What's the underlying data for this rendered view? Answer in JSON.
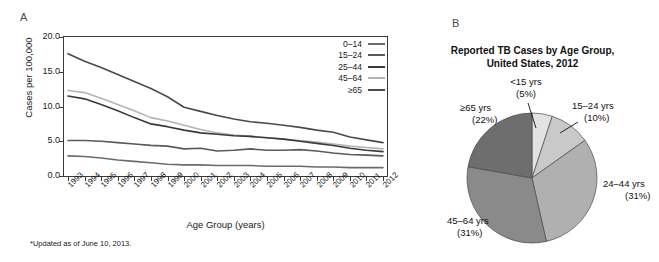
{
  "panel_a": {
    "letter": "A",
    "y_axis_title": "Cases per 100,000",
    "x_axis_title": "Age Group (years)",
    "footnote": "*Updated as of June 10, 2013.",
    "y_ticks": [
      "0.0",
      "5.0",
      "10.0",
      "15.0",
      "20.0"
    ],
    "legend": [
      {
        "label": "0–14",
        "color": "#6b6b6b"
      },
      {
        "label": "15–24",
        "color": "#5a5a5a"
      },
      {
        "label": "25–44",
        "color": "#3a3a3a"
      },
      {
        "label": "45–64",
        "color": "#b4b4b4"
      },
      {
        "label": "≥65",
        "color": "#4a4a4a"
      }
    ]
  },
  "panel_b": {
    "letter": "B",
    "title_line1": "Reported TB Cases by Age Group,",
    "title_line2": "United States, 2012",
    "labels": [
      {
        "name": "<15 yrs",
        "pct": "(5%)"
      },
      {
        "name": "15–24 yrs",
        "pct": "(10%)"
      },
      {
        "name": "24–44 yrs",
        "pct": "(31%)"
      },
      {
        "name": "45–64 yrs",
        "pct": "(31%)"
      },
      {
        "name": "≥65 yrs",
        "pct": "(22%)"
      }
    ]
  },
  "chart_data": [
    {
      "type": "line",
      "title": "",
      "xlabel": "Age Group (years)",
      "ylabel": "Cases per 100,000",
      "ylim": [
        0.0,
        20.0
      ],
      "grid": false,
      "legend_position": "top-right",
      "annotations": [
        "*Updated as of June 10, 2013."
      ],
      "categories": [
        "1993",
        "1994",
        "1995",
        "1996",
        "1997",
        "1998",
        "1999",
        "2000",
        "2001",
        "2002",
        "2003",
        "2004",
        "2005",
        "2006",
        "2007",
        "2008",
        "2009",
        "2010",
        "2011",
        "2012"
      ],
      "series": [
        {
          "name": "≥65",
          "color": "#4a4a4a",
          "values": [
            17.6,
            16.5,
            15.6,
            14.6,
            13.6,
            12.6,
            11.4,
            9.9,
            9.3,
            8.7,
            8.2,
            7.8,
            7.6,
            7.3,
            7.0,
            6.6,
            6.3,
            5.6,
            5.2,
            4.8
          ]
        },
        {
          "name": "45–64",
          "color": "#b4b4b4",
          "values": [
            12.3,
            12.0,
            11.2,
            10.3,
            9.4,
            8.4,
            7.9,
            7.3,
            6.7,
            6.2,
            5.9,
            5.7,
            5.5,
            5.3,
            5.1,
            4.9,
            4.6,
            4.3,
            4.1,
            3.9
          ]
        },
        {
          "name": "25–44",
          "color": "#3a3a3a",
          "values": [
            11.5,
            11.1,
            10.3,
            9.4,
            8.4,
            7.5,
            7.1,
            6.6,
            6.2,
            6.0,
            5.8,
            5.7,
            5.5,
            5.3,
            5.0,
            4.7,
            4.4,
            4.0,
            3.7,
            3.5
          ]
        },
        {
          "name": "15–24",
          "color": "#5a5a5a",
          "values": [
            5.1,
            5.1,
            5.0,
            4.8,
            4.6,
            4.4,
            4.3,
            3.9,
            4.0,
            3.6,
            3.7,
            3.9,
            3.7,
            3.7,
            3.8,
            3.6,
            3.3,
            3.1,
            3.0,
            2.9
          ]
        },
        {
          "name": "0–14",
          "color": "#6b6b6b",
          "values": [
            2.9,
            2.8,
            2.6,
            2.3,
            2.1,
            1.9,
            1.7,
            1.6,
            1.6,
            1.5,
            1.5,
            1.5,
            1.4,
            1.4,
            1.4,
            1.3,
            1.3,
            1.2,
            1.2,
            1.2
          ]
        }
      ]
    },
    {
      "type": "pie",
      "title": "Reported TB Cases by Age Group, United States, 2012",
      "labels": [
        "<15 yrs",
        "15–24 yrs",
        "24–44 yrs",
        "45–64 yrs",
        "≥65 yrs"
      ],
      "values": [
        5,
        10,
        31,
        31,
        22
      ],
      "colors": [
        "#e2e2e2",
        "#c9c9c9",
        "#b0b0b0",
        "#8a8a8a",
        "#6e6e6e"
      ],
      "legend_position": "callout-labels"
    }
  ]
}
